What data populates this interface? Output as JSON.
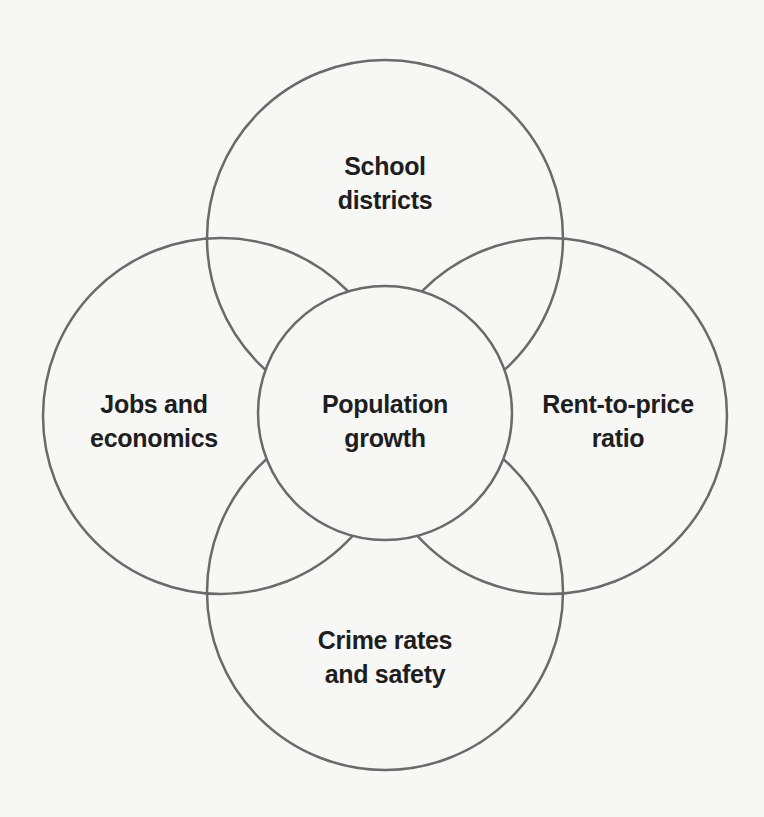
{
  "diagram": {
    "type": "flower-venn",
    "stroke_color": "#6a6a6a",
    "background": "#f7f7f6",
    "center": {
      "label_line1": "Population",
      "label_line2": "growth"
    },
    "petals": [
      {
        "position": "top",
        "label_line1": "School",
        "label_line2": "districts"
      },
      {
        "position": "left",
        "label_line1": "Jobs and",
        "label_line2": "economics"
      },
      {
        "position": "right",
        "label_line1": "Rent-to-price",
        "label_line2": "ratio"
      },
      {
        "position": "bottom",
        "label_line1": "Crime rates",
        "label_line2": "and safety"
      }
    ]
  }
}
